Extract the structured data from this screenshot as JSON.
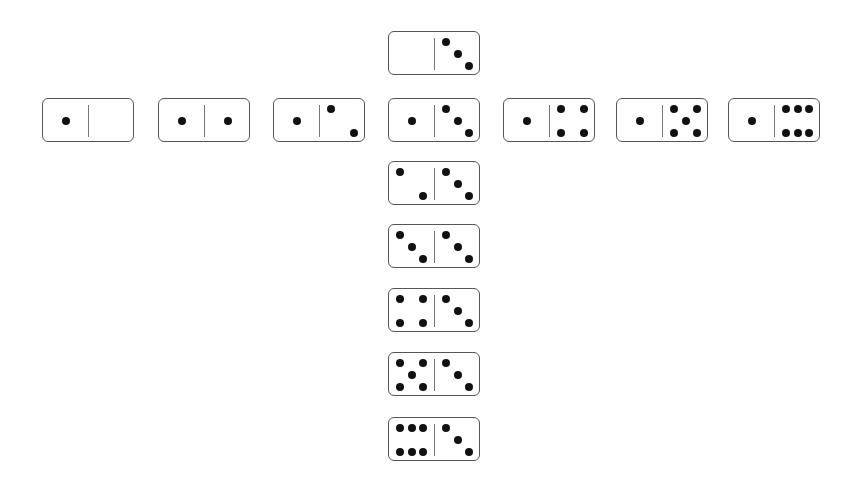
{
  "pip_color": "#111111",
  "border_color": "#555555",
  "dominoes": [
    {
      "id": "0-3",
      "left": 0,
      "right": 3,
      "x": 388,
      "y": 31
    },
    {
      "id": "1-0",
      "left": 1,
      "right": 0,
      "x": 42,
      "y": 98
    },
    {
      "id": "1-1",
      "left": 1,
      "right": 1,
      "x": 158,
      "y": 98
    },
    {
      "id": "1-2",
      "left": 1,
      "right": 2,
      "x": 273,
      "y": 98
    },
    {
      "id": "1-3",
      "left": 1,
      "right": 3,
      "x": 388,
      "y": 98
    },
    {
      "id": "1-4",
      "left": 1,
      "right": 4,
      "x": 503,
      "y": 98
    },
    {
      "id": "1-5",
      "left": 1,
      "right": 5,
      "x": 616,
      "y": 98
    },
    {
      "id": "1-6",
      "left": 1,
      "right": 6,
      "x": 728,
      "y": 98
    },
    {
      "id": "2-3",
      "left": 2,
      "right": 3,
      "x": 388,
      "y": 161
    },
    {
      "id": "3-3",
      "left": 3,
      "right": 3,
      "x": 388,
      "y": 224
    },
    {
      "id": "4-3",
      "left": 4,
      "right": 3,
      "x": 388,
      "y": 288
    },
    {
      "id": "5-3",
      "left": 5,
      "right": 3,
      "x": 388,
      "y": 352
    },
    {
      "id": "6-3",
      "left": 6,
      "right": 3,
      "x": 388,
      "y": 417
    }
  ]
}
